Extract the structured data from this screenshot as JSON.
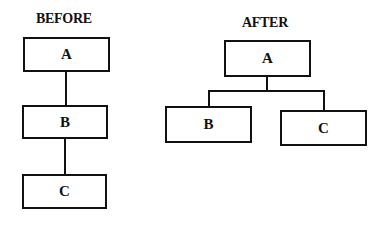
{
  "before": {
    "title": "BEFORE",
    "nodes": [
      {
        "id": "A",
        "label": "A"
      },
      {
        "id": "B",
        "label": "B"
      },
      {
        "id": "C",
        "label": "C"
      }
    ],
    "edges": [
      [
        "A",
        "B"
      ],
      [
        "B",
        "C"
      ]
    ]
  },
  "after": {
    "title": "AFTER",
    "nodes": [
      {
        "id": "A",
        "label": "A"
      },
      {
        "id": "B",
        "label": "B"
      },
      {
        "id": "C",
        "label": "C"
      }
    ],
    "edges": [
      [
        "A",
        "B"
      ],
      [
        "A",
        "C"
      ]
    ]
  }
}
